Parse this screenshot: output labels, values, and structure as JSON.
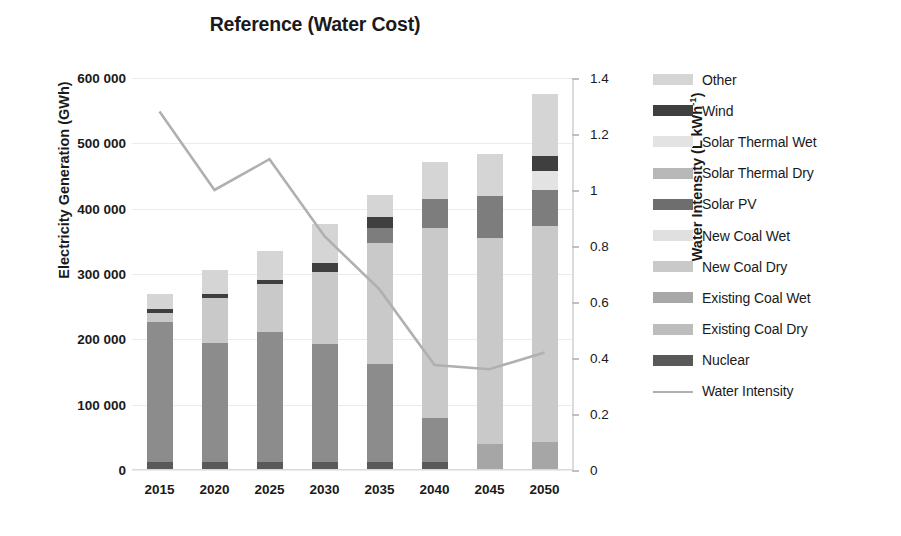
{
  "chart_data": {
    "type": "bar",
    "title": "Reference (Water Cost)",
    "xlabel": "",
    "ylabel": "Electricity Generation (GWh)",
    "ylabel_secondary": "Water Intensity (L kWh",
    "ylabel_secondary_sup": "-1",
    "ylabel_secondary_tail": ")",
    "grid": true,
    "legend_position": "right",
    "categories": [
      "2015",
      "2020",
      "2025",
      "2030",
      "2035",
      "2040",
      "2045",
      "2050"
    ],
    "ylim": [
      0,
      600000
    ],
    "yticks": [
      "0",
      "100 000",
      "200 000",
      "300 000",
      "400 000",
      "500 000",
      "600 000"
    ],
    "ytick_values": [
      0,
      100000,
      200000,
      300000,
      400000,
      500000,
      600000
    ],
    "ylim_secondary": [
      0,
      1.4
    ],
    "yticks_secondary": [
      "0",
      "0.2",
      "0.4",
      "0.6",
      "0.8",
      "1",
      "1.2",
      "1.4"
    ],
    "ytick_values_secondary": [
      0,
      0.2,
      0.4,
      0.6,
      0.8,
      1.0,
      1.2,
      1.4
    ],
    "stack_order_bottom_up": [
      "Nuclear",
      "Existing Coal  Dry",
      "Existing Coal  Wet",
      "New Coal  Dry",
      "New Coal  Wet",
      "Solar PV",
      "Solar Thermal Dry",
      "Solar Thermal Wet",
      "Wind",
      "Other"
    ],
    "series": [
      {
        "name": "Nuclear",
        "color": "#595959",
        "values": [
          13000,
          13000,
          13000,
          13000,
          13000,
          13000,
          0,
          0
        ]
      },
      {
        "name": "Existing Coal  Dry",
        "color": "#a6a6a6",
        "values": [
          0,
          0,
          0,
          0,
          0,
          0,
          40000,
          43000
        ]
      },
      {
        "name": "Existing Coal  Wet",
        "color": "#8c8c8c",
        "values": [
          213000,
          182000,
          199000,
          180000,
          150000,
          67000,
          0,
          0
        ]
      },
      {
        "name": "New Coal  Dry",
        "color": "#9e9e9e",
        "values": [
          0,
          0,
          0,
          0,
          0,
          0,
          0,
          0
        ]
      },
      {
        "name": "New Coal  Wet",
        "color": "#c9c9c9",
        "values": [
          14000,
          68000,
          73000,
          110000,
          185000,
          290000,
          315000,
          330000
        ]
      },
      {
        "name": "Solar PV",
        "color": "#6e6e6e",
        "values": [
          0,
          0,
          0,
          0,
          0,
          0,
          0,
          0
        ]
      },
      {
        "name": "Solar Thermal Dry",
        "color": "#7d7d7d",
        "values": [
          0,
          0,
          0,
          0,
          22000,
          45000,
          65000,
          55000
        ]
      },
      {
        "name": "Solar Thermal Wet",
        "color": "#e3e3e3",
        "values": [
          0,
          0,
          0,
          0,
          0,
          0,
          0,
          30000
        ]
      },
      {
        "name": "Wind",
        "color": "#3f3f3f",
        "values": [
          7000,
          7000,
          6000,
          14000,
          18000,
          0,
          0,
          22000
        ]
      },
      {
        "name": "Other",
        "color": "#d5d5d5",
        "values": [
          22000,
          36000,
          45000,
          60000,
          33000,
          56000,
          64000,
          95000
        ]
      }
    ],
    "totals": [
      269000,
      306000,
      336000,
      377000,
      421000,
      471000,
      484000,
      575000
    ],
    "line_series": {
      "name": "Water Intensity",
      "color": "#b0b0b0",
      "values": [
        1.28,
        1.0,
        1.11,
        0.835,
        0.645,
        0.375,
        0.36,
        0.42
      ]
    },
    "legend": [
      {
        "label": "Other",
        "color": "#d5d5d5",
        "kind": "swatch"
      },
      {
        "label": "Wind",
        "color": "#3f3f3f",
        "kind": "swatch"
      },
      {
        "label": "Solar Thermal Wet",
        "color": "#e3e3e3",
        "kind": "swatch"
      },
      {
        "label": "Solar Thermal Dry",
        "color": "#b8b8b8",
        "kind": "swatch"
      },
      {
        "label": "Solar PV",
        "color": "#6e6e6e",
        "kind": "swatch"
      },
      {
        "label": "New Coal  Wet",
        "color": "#e0e0e0",
        "kind": "swatch"
      },
      {
        "label": "New Coal  Dry",
        "color": "#c9c9c9",
        "kind": "swatch"
      },
      {
        "label": "Existing Coal  Wet",
        "color": "#a8a8a8",
        "kind": "swatch"
      },
      {
        "label": "Existing Coal  Dry",
        "color": "#bdbdbd",
        "kind": "swatch"
      },
      {
        "label": "Nuclear",
        "color": "#595959",
        "kind": "swatch"
      },
      {
        "label": "Water Intensity",
        "color": "#b0b0b0",
        "kind": "line"
      }
    ]
  }
}
